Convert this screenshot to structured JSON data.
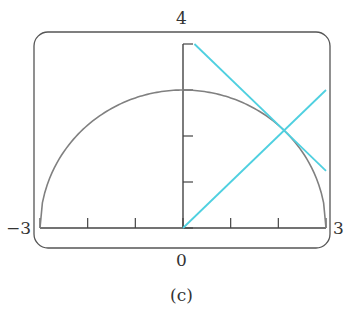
{
  "figure": {
    "caption": "(c)",
    "window_labels": {
      "ymax": "4",
      "xmin": "−3",
      "xmax": "3",
      "origin": "0"
    }
  },
  "chart_data": {
    "type": "line",
    "title": "",
    "caption": "(c)",
    "xlabel": "",
    "ylabel": "",
    "xlim": [
      -3,
      3
    ],
    "ylim": [
      0,
      4
    ],
    "x_ticks": [
      -3,
      -2,
      -1,
      0,
      1,
      2,
      3
    ],
    "y_ticks": [
      0,
      1,
      2,
      3,
      4
    ],
    "grid": false,
    "legend": null,
    "series": [
      {
        "name": "semicircle y = sqrt(9 - x^2)",
        "color": "#808080",
        "x": [
          -3,
          -2.5,
          -2,
          -1.5,
          -1,
          -0.5,
          0,
          0.5,
          1,
          1.5,
          2,
          2.5,
          3
        ],
        "y": [
          0,
          1.66,
          2.24,
          2.6,
          2.83,
          2.96,
          3,
          2.96,
          2.83,
          2.6,
          2.24,
          1.66,
          0
        ]
      },
      {
        "name": "line y = x",
        "color": "#4fd0e0",
        "x": [
          0,
          3
        ],
        "y": [
          0,
          3
        ]
      },
      {
        "name": "tangent line y = -x + 4.24",
        "color": "#4fd0e0",
        "x": [
          0.24,
          3
        ],
        "y": [
          4,
          1.24
        ]
      }
    ]
  }
}
